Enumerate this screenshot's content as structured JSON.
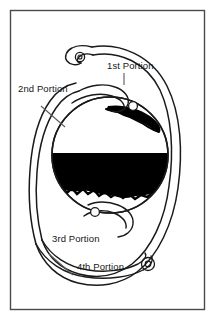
{
  "figure": {
    "background_color": "#ffffff",
    "frame": {
      "stroke_color": "#4a4a4a",
      "fill_color": "#ffffff",
      "x": 10,
      "y": 10,
      "width": 195,
      "height": 300
    },
    "ink_color": "#1a1a1a",
    "fill_black": "#000000"
  },
  "labels": {
    "portion_1": "1st Portion",
    "portion_2": "2nd Portion",
    "portion_3": "3rd Portion",
    "portion_4": "4th Portion"
  },
  "label_positions": {
    "portion_1": {
      "x": 107,
      "y": 69
    },
    "portion_2": {
      "x": 18,
      "y": 92
    },
    "portion_3": {
      "x": 52,
      "y": 242
    },
    "portion_4": {
      "x": 77,
      "y": 270
    }
  },
  "anatomy": {
    "duodenal_loop_name": "duodenum-c-loop",
    "sphere_name": "stomach-sphere",
    "black_band_name": "contrast-band",
    "markers": [
      {
        "name": "marker-top-loop",
        "cx": 80,
        "cy": 57,
        "r": 4.2
      },
      {
        "name": "marker-upper-right",
        "cx": 133,
        "cy": 106,
        "r": 4.2
      },
      {
        "name": "marker-lower-left",
        "cx": 95,
        "cy": 212,
        "r": 4.2
      },
      {
        "name": "marker-bottom-loop",
        "cx": 148,
        "cy": 264,
        "r": 4.2
      }
    ]
  },
  "leader_lines": [
    {
      "name": "leader-portion-1",
      "x1": 124,
      "y1": 73,
      "x2": 124,
      "y2": 84
    },
    {
      "name": "leader-portion-2",
      "x1": 41,
      "y1": 108,
      "x2": 63,
      "y2": 126
    },
    {
      "name": "leader-portion-4",
      "x1": 50,
      "y1": 255,
      "x2": 72,
      "y2": 274
    }
  ]
}
